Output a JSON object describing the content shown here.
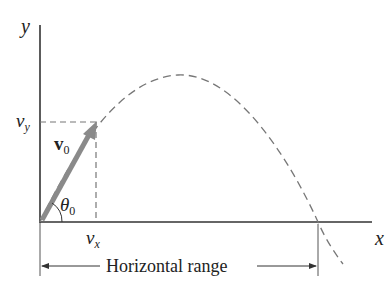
{
  "diagram": {
    "type": "projectile-motion",
    "axes": {
      "x_label": "x",
      "y_label": "y"
    },
    "vector": {
      "symbol": "v",
      "subscript": "0",
      "color": "#8a8a8a"
    },
    "angle": {
      "symbol": "θ",
      "subscript": "0"
    },
    "components": {
      "vy": {
        "symbol": "v",
        "subscript": "y"
      },
      "vx": {
        "symbol": "v",
        "subscript": "x"
      }
    },
    "range_label": "Horizontal range",
    "colors": {
      "axis": "#333333",
      "dashed": "#777777",
      "arrow": "#8a8a8a"
    }
  }
}
